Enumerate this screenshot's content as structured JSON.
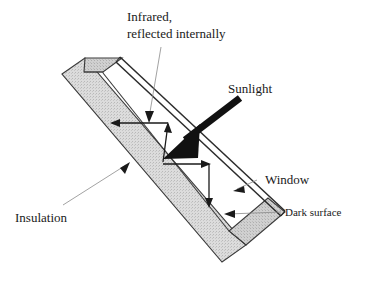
{
  "figure": {
    "background_color": "#ffffff",
    "width": 369,
    "height": 290
  },
  "labels": {
    "infrared_line1": "Infrared,",
    "infrared_line2": "reflected internally",
    "sunlight": "Sunlight",
    "window": "Window",
    "dark_surface": "Dark surface",
    "insulation": "Insulation"
  },
  "colors": {
    "insulation_fill": "#d4d4d4",
    "insulation_stroke": "#3a3a3a",
    "window_stroke": "#2b2b2b",
    "sunlight_arrow": "#111111",
    "ray_stroke": "#1a1a1a",
    "leader_stroke": "#8a8a8a",
    "text": "#1a1a1a"
  },
  "elements": {
    "insulation_band_name": "insulation-band",
    "window_pane_name": "window-pane",
    "sunlight_arrow_name": "sunlight-arrow",
    "infrared_rays_name": "infrared-ray-arrows",
    "dark_surface_name": "dark-surface-edge"
  }
}
